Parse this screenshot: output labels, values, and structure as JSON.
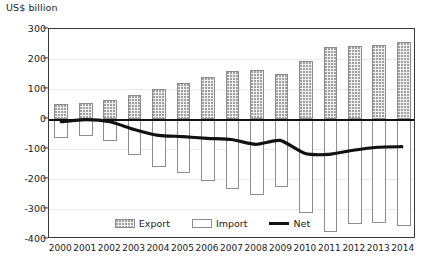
{
  "chart_data": {
    "type": "bar",
    "title": "",
    "subtitle": "",
    "xlabel": "",
    "ylabel": "US$ billion",
    "ylim": [
      -400,
      300
    ],
    "ytick_values": [
      300,
      200,
      100,
      0,
      -100,
      -200,
      -300,
      -400
    ],
    "ytick_labels": [
      "300",
      "200",
      "100",
      "0",
      "-100",
      "-200",
      "-300",
      "-400"
    ],
    "grid": true,
    "legend_position": "bottom-center",
    "categories": [
      "2000",
      "2001",
      "2002",
      "2003",
      "2004",
      "2005",
      "2006",
      "2007",
      "2008",
      "2009",
      "2010",
      "2011",
      "2012",
      "2013",
      "2014"
    ],
    "series": [
      {
        "name": "Export",
        "type": "bar",
        "style": "stippled-fill",
        "values": [
          50,
          55,
          62,
          80,
          100,
          120,
          140,
          160,
          162,
          150,
          195,
          240,
          245,
          248,
          258
        ]
      },
      {
        "name": "Import",
        "type": "bar",
        "style": "white-fill",
        "values": [
          -62,
          -58,
          -72,
          -120,
          -160,
          -180,
          -205,
          -232,
          -252,
          -225,
          -312,
          -378,
          -350,
          -345,
          -355
        ]
      },
      {
        "name": "Net",
        "type": "line",
        "style": "thick-black-line",
        "values": [
          -12,
          -5,
          -12,
          -38,
          -58,
          -62,
          -68,
          -72,
          -88,
          -75,
          -118,
          -122,
          -108,
          -98,
          -96
        ]
      }
    ]
  },
  "axis": {
    "y_title": "US$ billion"
  },
  "legend": {
    "items": [
      {
        "label": "Export",
        "swatch": "export-swatch"
      },
      {
        "label": "Import",
        "swatch": "import-swatch"
      },
      {
        "label": "Net",
        "swatch": "net-line-swatch"
      }
    ]
  }
}
